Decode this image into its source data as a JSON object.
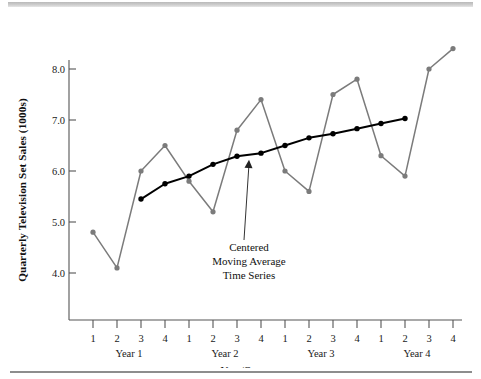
{
  "chart_data": {
    "type": "line",
    "title": "",
    "xlabel": "Year/Quarter",
    "ylabel": "Quarterly Television Set Sales (1000s)",
    "ylim": [
      3.4,
      8.8
    ],
    "yticks": [
      4.0,
      5.0,
      6.0,
      7.0,
      8.0
    ],
    "ytick_labels": [
      "4.0",
      "5.0",
      "6.0",
      "7.0",
      "8.0"
    ],
    "grid": false,
    "legend": "none",
    "categories": [
      "1",
      "2",
      "3",
      "4",
      "1",
      "2",
      "3",
      "4",
      "1",
      "2",
      "3",
      "4",
      "1",
      "2",
      "3",
      "4"
    ],
    "group_labels": [
      "Year 1",
      "Year 2",
      "Year 3",
      "Year 4"
    ],
    "series": [
      {
        "name": "Quarterly Television Set Sales",
        "color": "#7b7b7b",
        "x": [
          1,
          2,
          3,
          4,
          5,
          6,
          7,
          8,
          9,
          10,
          11,
          12,
          13,
          14,
          15,
          16
        ],
        "values": [
          4.8,
          4.1,
          6.0,
          6.5,
          5.8,
          5.2,
          6.8,
          7.4,
          6.0,
          5.6,
          7.5,
          7.8,
          6.3,
          5.9,
          8.0,
          8.4
        ]
      },
      {
        "name": "Centered Moving Average Time Series",
        "color": "#000000",
        "x": [
          3,
          4,
          5,
          6,
          7,
          8,
          9,
          10,
          11,
          12,
          13,
          14
        ],
        "values": [
          5.45,
          5.75,
          5.9,
          6.13,
          6.29,
          6.35,
          6.5,
          6.65,
          6.73,
          6.83,
          6.93,
          7.03
        ]
      }
    ],
    "annotations": [
      {
        "name": "centered-moving-average",
        "lines": [
          "Centered",
          "Moving Average",
          "Time Series"
        ],
        "target_x": 7.5,
        "target_y": 6.22
      }
    ]
  },
  "figure": {
    "y_axis_title": "Quarterly Television Set Sales (1000s)",
    "x_axis_title": "Year/Quarter",
    "y_tick_labels": [
      "8.0",
      "7.0",
      "6.0",
      "5.0",
      "4.0"
    ],
    "x_tick_labels": [
      "1",
      "2",
      "3",
      "4",
      "1",
      "2",
      "3",
      "4",
      "1",
      "2",
      "3",
      "4",
      "1",
      "2",
      "3",
      "4"
    ],
    "year_labels": [
      "Year 1",
      "Year 2",
      "Year 3",
      "Year 4"
    ],
    "annotation_lines": [
      "Centered",
      "Moving Average",
      "Time Series"
    ]
  }
}
